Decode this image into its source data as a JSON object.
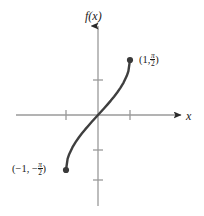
{
  "figure": {
    "y_axis_label": "f(x)",
    "x_axis_label": "x",
    "upper_point_open": "(1,",
    "upper_point_close": ")",
    "upper_frac_num": "π",
    "upper_frac_den": "2",
    "lower_point_open": "(−1, −",
    "lower_point_close": ")",
    "lower_frac_num": "π",
    "lower_frac_den": "2",
    "curve_color": "#3f3f3f",
    "axis_color": "#9a9a9a",
    "tick_color": "#9a9a9a",
    "point_color": "#3a3a3a",
    "background_color": "#ffffff"
  },
  "chart_data": {
    "type": "line",
    "title": "",
    "subtitle": "",
    "xlabel": "x",
    "ylabel": "f(x)",
    "legend": [],
    "grid": false,
    "axis_style": "arrowed-cartesian-axes",
    "origin_px": [
      98,
      115
    ],
    "x_unit_px": 32,
    "y_unit_px": 35,
    "xlim": [
      -2.3,
      2.6
    ],
    "ylim": [
      -2.7,
      2.6
    ],
    "x_ticks": [
      -1,
      1
    ],
    "y_ticks": [
      1,
      -1,
      -2
    ],
    "x_tick_labels": [
      "",
      ""
    ],
    "y_tick_labels": [
      "",
      "",
      ""
    ],
    "annotations": [
      {
        "text": "(1, π/2)",
        "x": 1,
        "y": 1.5708,
        "position": "right"
      },
      {
        "text": "(−1, −π/2)",
        "x": -1,
        "y": -1.5708,
        "position": "left"
      }
    ],
    "endpoints": [
      {
        "x": -1,
        "y": -1.5708,
        "marker": "filled-circle"
      },
      {
        "x": 1,
        "y": 1.5708,
        "marker": "filled-circle"
      }
    ],
    "series": [
      {
        "name": "arcsin(x)",
        "description": "odd increasing S-shaped curve through origin from (-1, -pi/2) to (1, pi/2)",
        "x": [
          -1.0,
          -0.95,
          -0.9,
          -0.8,
          -0.7,
          -0.6,
          -0.5,
          -0.4,
          -0.3,
          -0.2,
          -0.1,
          0.0,
          0.1,
          0.2,
          0.3,
          0.4,
          0.5,
          0.6,
          0.7,
          0.8,
          0.9,
          0.95,
          1.0
        ],
        "y": [
          -1.5708,
          -1.2532,
          -1.1198,
          -0.9273,
          -0.7754,
          -0.6435,
          -0.5236,
          -0.4115,
          -0.3047,
          -0.2014,
          -0.1002,
          0.0,
          0.1002,
          0.2014,
          0.3047,
          0.4115,
          0.5236,
          0.6435,
          0.7754,
          0.9273,
          1.1198,
          1.2532,
          1.5708
        ]
      }
    ]
  }
}
